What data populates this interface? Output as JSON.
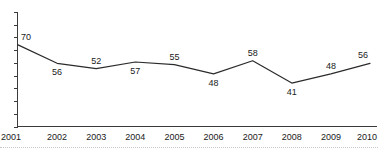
{
  "chart_data": {
    "type": "line",
    "title": "",
    "subtitle": "",
    "xlabel": "",
    "ylabel": "",
    "categories": [
      "2001",
      "2002",
      "2003",
      "2004",
      "2005",
      "2006",
      "2007",
      "2008",
      "2009",
      "2010"
    ],
    "values": [
      70,
      56,
      52,
      57,
      55,
      48,
      58,
      41,
      48,
      56
    ],
    "series": [
      {
        "name": "",
        "values": [
          70,
          56,
          52,
          57,
          55,
          48,
          58,
          41,
          48,
          56
        ]
      }
    ],
    "data_labels": [
      "70",
      "56",
      "52",
      "57",
      "55",
      "48",
      "58",
      "41",
      "48",
      "56"
    ],
    "data_label_positions": [
      "above",
      "below",
      "above",
      "below",
      "above",
      "below",
      "above",
      "below",
      "above",
      "above"
    ],
    "xtick_labels": [
      "2001",
      "2002",
      "2003",
      "2004",
      "2005",
      "2006",
      "2007",
      "2008",
      "2009",
      "2010"
    ],
    "ytick_labels": [],
    "ytick_count": 10,
    "ylim": [
      8,
      95
    ],
    "xlim": [
      "2001",
      "2010"
    ],
    "grid": false,
    "legend": false,
    "legend_position": "none",
    "annotations": [],
    "colors": {
      "line": "#2b2b2b",
      "axis": "#3a3a3a",
      "text": "#1a1a1a",
      "background": "#ffffff",
      "footer_rule": "#c8c8c8"
    }
  }
}
